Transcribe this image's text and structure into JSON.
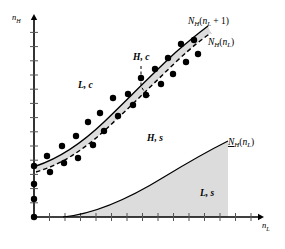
{
  "figure": {
    "name": "phase-diagram-nL-nH",
    "background_color": "#ffffff",
    "ink_color": "#000000",
    "shade_color": "#dcdcdc"
  },
  "axes": {
    "x": {
      "label_main": "n",
      "label_sub": "L",
      "name": "x-axis",
      "tick_count": 14,
      "tick_spacing_px": 15.5,
      "origin_px": [
        34,
        217
      ],
      "end_px": [
        258,
        217
      ]
    },
    "y": {
      "label_main": "n",
      "label_sub": "H",
      "name": "y-axis",
      "tick_count": 13,
      "tick_spacing_px": 14.2,
      "origin_px": [
        34,
        217
      ],
      "end_px": [
        34,
        20
      ]
    }
  },
  "curve_labels": [
    {
      "id": "upper-solid-curve-label",
      "text_main": "N",
      "text_sub": "H",
      "text_arg_open": "(n",
      "text_arg_sub": "L",
      "text_arg_close": " + 1)",
      "full": "N_H(n_L + 1)",
      "underline": false,
      "x": 188,
      "y": 24
    },
    {
      "id": "upper-dashed-curve-label",
      "text_main": "N",
      "text_sub": "H",
      "text_arg_open": "(n",
      "text_arg_sub": "L",
      "text_arg_close": ")",
      "full": "N_H(n_L)",
      "underline": false,
      "x": 208,
      "y": 45
    },
    {
      "id": "lower-solid-curve-label",
      "text_main": "N",
      "text_sub": "H",
      "text_arg_open": "(n",
      "text_arg_sub": "L",
      "text_arg_close": ")",
      "full": "N_H(n_L)",
      "underline": true,
      "x": 228,
      "y": 145
    }
  ],
  "region_labels": [
    {
      "id": "region-L-c",
      "text": "L, c",
      "x": 78,
      "y": 88
    },
    {
      "id": "region-H-c",
      "text": "H, c",
      "x": 133,
      "y": 60
    },
    {
      "id": "region-H-s",
      "text": "H, s",
      "x": 147,
      "y": 141
    },
    {
      "id": "region-L-s",
      "text": "L, s",
      "x": 200,
      "y": 196
    }
  ],
  "leader_line": {
    "id": "H-c-leader",
    "style": "dashed",
    "points": "141,66 141,86 145,93 150,96"
  },
  "chart_data": {
    "type": "scatter",
    "title": "",
    "xlabel": "n_L",
    "ylabel": "n_H",
    "grid": false,
    "legend": "none",
    "axis_ticks_only": true,
    "xlim_px": [
      34,
      258
    ],
    "ylim_px": [
      217,
      20
    ],
    "series": [
      {
        "name": "N_H(n_L + 1)",
        "type": "line",
        "style": "solid",
        "width": 1.4,
        "path_px": "M 36,166 C 60,158 82,143 104,122 C 126,101 150,76 176,52 C 190,40 200,32 208,26"
      },
      {
        "name": "N_H(n_L)",
        "type": "line",
        "style": "dashed",
        "width": 1.4,
        "path_px": "M 36,172 C 60,165 82,151 104,131 C 126,111 152,85 178,60 C 192,47 202,39 211,33"
      },
      {
        "name": "band-between-curves",
        "type": "area",
        "fill": "#dcdcdc",
        "path_px": "M 36,166 C 60,158 82,143 104,122 C 126,101 150,76 176,52 C 190,40 200,32 208,26 L 211,33 C 202,39 192,47 178,60 C 152,85 126,111 104,131 C 82,151 60,165 36,172 Z"
      },
      {
        "name": "underline-N_H(n_L)",
        "type": "line",
        "style": "solid",
        "width": 1.2,
        "path_px": "M 63,217 C 95,214 130,198 164,177 C 192,160 214,148 228,141"
      },
      {
        "name": "L,s-shaded-area",
        "type": "area",
        "fill": "#dcdcdc",
        "path_px": "M 63,217 C 95,214 130,198 164,177 C 192,160 214,148 228,141 L 228,217 Z"
      },
      {
        "name": "observations",
        "type": "scatter",
        "marker": "filled-circle",
        "radius_px": 3.2,
        "points_px": [
          [
            34,
            217
          ],
          [
            34,
            199
          ],
          [
            34,
            184
          ],
          [
            34,
            166
          ],
          [
            47,
            156
          ],
          [
            50,
            172
          ],
          [
            62,
            146
          ],
          [
            64,
            163
          ],
          [
            76,
            136
          ],
          [
            78,
            158
          ],
          [
            88,
            122
          ],
          [
            93,
            145
          ],
          [
            100,
            113
          ],
          [
            104,
            131
          ],
          [
            113,
            98
          ],
          [
            118,
            116
          ],
          [
            128,
            94
          ],
          [
            133,
            105
          ],
          [
            141,
            78
          ],
          [
            146,
            95
          ],
          [
            155,
            69
          ],
          [
            161,
            84
          ],
          [
            168,
            58
          ],
          [
            173,
            74
          ],
          [
            181,
            44
          ],
          [
            186,
            62
          ],
          [
            194,
            40
          ],
          [
            198,
            54
          ]
        ]
      }
    ]
  }
}
